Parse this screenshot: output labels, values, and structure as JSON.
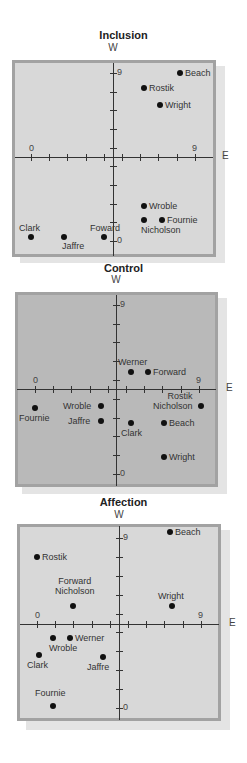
{
  "chart_data": [
    {
      "type": "scatter",
      "title": "Inclusion",
      "ylabel": "W",
      "xlabel": "E",
      "xlim": [
        0,
        9
      ],
      "ylim": [
        0,
        9
      ],
      "x_ticks": [
        "0",
        "9"
      ],
      "y_ticks": [
        "0",
        "9"
      ],
      "grid": false,
      "points": [
        {
          "name": "Beach",
          "x": 8.2,
          "y": 9.0
        },
        {
          "name": "Rostik",
          "x": 6.2,
          "y": 8.2
        },
        {
          "name": "Wright",
          "x": 7.1,
          "y": 7.3
        },
        {
          "name": "Wroble",
          "x": 6.2,
          "y": 1.9
        },
        {
          "name": "Nicholson",
          "x": 6.2,
          "y": 1.1
        },
        {
          "name": "Fournie",
          "x": 7.2,
          "y": 1.1
        },
        {
          "name": "Clark",
          "x": 0.0,
          "y": 0.2
        },
        {
          "name": "Jaffre",
          "x": 1.8,
          "y": 0.2
        },
        {
          "name": "Foward",
          "x": 4.0,
          "y": 0.2
        }
      ]
    },
    {
      "type": "scatter",
      "title": "Control",
      "ylabel": "W",
      "xlabel": "E",
      "xlim": [
        0,
        9
      ],
      "ylim": [
        0,
        9
      ],
      "x_ticks": [
        "0",
        "9"
      ],
      "y_ticks": [
        "0",
        "9"
      ],
      "grid": false,
      "points": [
        {
          "name": "Werner",
          "x": 5.3,
          "y": 5.4
        },
        {
          "name": "Forward",
          "x": 6.2,
          "y": 5.4
        },
        {
          "name": "Fournie",
          "x": 0.0,
          "y": 3.5
        },
        {
          "name": "Wroble",
          "x": 3.6,
          "y": 3.6
        },
        {
          "name": "Jaffre",
          "x": 3.6,
          "y": 2.8
        },
        {
          "name": "Clark",
          "x": 5.3,
          "y": 2.7
        },
        {
          "name": "Rostik / Nicholson",
          "x": 9.1,
          "y": 3.6
        },
        {
          "name": "Beach",
          "x": 7.1,
          "y": 2.7
        },
        {
          "name": "Wright",
          "x": 7.1,
          "y": 0.9
        }
      ]
    },
    {
      "type": "scatter",
      "title": "Affection",
      "ylabel": "W",
      "xlabel": "E",
      "xlim": [
        0,
        9
      ],
      "ylim": [
        0,
        9
      ],
      "x_ticks": [
        "0",
        "9"
      ],
      "y_ticks": [
        "0",
        "9"
      ],
      "grid": false,
      "points": [
        {
          "name": "Beach",
          "x": 7.3,
          "y": 9.3
        },
        {
          "name": "Rostik",
          "x": 0.0,
          "y": 8.0
        },
        {
          "name": "Forward / Nicholson",
          "x": 2.0,
          "y": 5.4
        },
        {
          "name": "Wright",
          "x": 7.4,
          "y": 5.4
        },
        {
          "name": "Wroble",
          "x": 0.9,
          "y": 3.7
        },
        {
          "name": "Werner",
          "x": 1.8,
          "y": 3.7
        },
        {
          "name": "Clark",
          "x": 0.1,
          "y": 2.8
        },
        {
          "name": "Jaffre",
          "x": 3.6,
          "y": 2.7
        },
        {
          "name": "Fournie",
          "x": 0.9,
          "y": 0.1
        }
      ]
    }
  ],
  "panels": [
    {
      "title": "Inclusion",
      "w_label": "W",
      "e_label": "E",
      "x_zero": "0",
      "x_nine": "9",
      "y_nine": "9",
      "y_zero": "0",
      "background": "light"
    },
    {
      "title": "Control",
      "w_label": "W",
      "e_label": "E",
      "x_zero": "0",
      "x_nine": "9",
      "y_nine": "9",
      "y_zero": "0",
      "background": "dark"
    },
    {
      "title": "Affection",
      "w_label": "W",
      "e_label": "E",
      "x_zero": "0",
      "x_nine": "9",
      "y_nine": "9",
      "y_zero": "0",
      "background": "light"
    }
  ]
}
